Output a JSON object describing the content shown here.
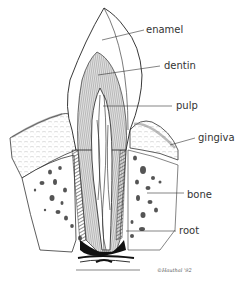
{
  "diagram": {
    "labels": [
      {
        "id": "enamel",
        "text": "enamel",
        "x": 146,
        "y": 25,
        "line": [
          102,
          40,
          144,
          30
        ]
      },
      {
        "id": "dentin",
        "text": "dentin",
        "x": 164,
        "y": 61,
        "line": [
          98,
          75,
          160,
          66
        ]
      },
      {
        "id": "pulp",
        "text": "pulp",
        "x": 176,
        "y": 101,
        "line": [
          103,
          106,
          172,
          106
        ]
      },
      {
        "id": "gingiva",
        "text": "gingiva",
        "x": 198,
        "y": 133,
        "line": [
          170,
          145,
          195,
          138
        ]
      },
      {
        "id": "bone",
        "text": "bone",
        "x": 187,
        "y": 190,
        "line": [
          147,
          193,
          184,
          193
        ]
      },
      {
        "id": "root",
        "text": "root",
        "x": 179,
        "y": 226,
        "line": [
          126,
          231,
          176,
          231
        ]
      }
    ],
    "signature": "©Hauthal '92",
    "colors": {
      "ink": "#2a2a2a",
      "hatch": "#555555",
      "background": "#ffffff"
    }
  }
}
